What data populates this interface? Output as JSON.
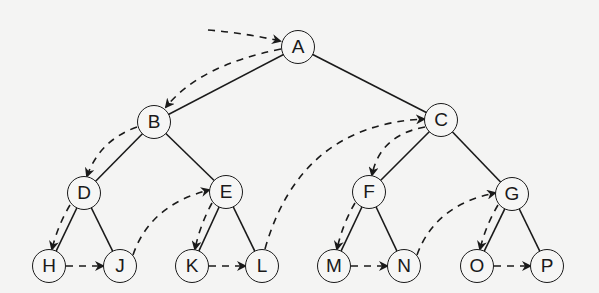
{
  "diagram": {
    "type": "binary-tree-preorder-traversal",
    "traversal_order": [
      "A",
      "B",
      "D",
      "H",
      "J",
      "E",
      "K",
      "L",
      "C",
      "F",
      "M",
      "N",
      "G",
      "O",
      "P"
    ],
    "colors": {
      "background": "#f4f4f3",
      "stroke": "#1a1a1a"
    },
    "nodes": [
      {
        "id": "A",
        "label": "A",
        "x": 298,
        "y": 47
      },
      {
        "id": "B",
        "label": "B",
        "x": 154,
        "y": 122
      },
      {
        "id": "C",
        "label": "C",
        "x": 441,
        "y": 120
      },
      {
        "id": "D",
        "label": "D",
        "x": 84,
        "y": 193
      },
      {
        "id": "E",
        "label": "E",
        "x": 226,
        "y": 192
      },
      {
        "id": "F",
        "label": "F",
        "x": 369,
        "y": 192
      },
      {
        "id": "G",
        "label": "G",
        "x": 512,
        "y": 194
      },
      {
        "id": "H",
        "label": "H",
        "x": 49,
        "y": 266
      },
      {
        "id": "J",
        "label": "J",
        "x": 120,
        "y": 266
      },
      {
        "id": "K",
        "label": "K",
        "x": 192,
        "y": 266
      },
      {
        "id": "L",
        "label": "L",
        "x": 262,
        "y": 266
      },
      {
        "id": "M",
        "label": "M",
        "x": 334,
        "y": 266
      },
      {
        "id": "N",
        "label": "N",
        "x": 404,
        "y": 266
      },
      {
        "id": "O",
        "label": "O",
        "x": 477,
        "y": 266
      },
      {
        "id": "P",
        "label": "P",
        "x": 547,
        "y": 266
      }
    ],
    "edges": [
      [
        "A",
        "B"
      ],
      [
        "A",
        "C"
      ],
      [
        "B",
        "D"
      ],
      [
        "B",
        "E"
      ],
      [
        "C",
        "F"
      ],
      [
        "C",
        "G"
      ],
      [
        "D",
        "H"
      ],
      [
        "D",
        "J"
      ],
      [
        "E",
        "K"
      ],
      [
        "E",
        "L"
      ],
      [
        "F",
        "M"
      ],
      [
        "F",
        "N"
      ],
      [
        "G",
        "O"
      ],
      [
        "G",
        "P"
      ]
    ],
    "traversal_arrows": [
      {
        "from": "start",
        "to": "A",
        "path": "M208,30 Q245,33 280,41"
      },
      {
        "from": "A",
        "to": "B",
        "path": "M281,49 Q200,65 166,107"
      },
      {
        "from": "B",
        "to": "D",
        "path": "M137,127 Q100,140 87,176"
      },
      {
        "from": "D",
        "to": "H",
        "path": "M70,205 Q58,225 52,249"
      },
      {
        "from": "H",
        "to": "J",
        "path": "M66,266 L103,266"
      },
      {
        "from": "J",
        "to": "E",
        "path": "M133,255 Q150,205 209,190"
      },
      {
        "from": "E",
        "to": "K",
        "path": "M212,203 Q200,225 195,249"
      },
      {
        "from": "K",
        "to": "L",
        "path": "M209,266 L245,266"
      },
      {
        "from": "L",
        "to": "C",
        "path": "M265,249 Q300,125 424,119"
      },
      {
        "from": "C",
        "to": "F",
        "path": "M425,127 Q380,135 372,175"
      },
      {
        "from": "F",
        "to": "M",
        "path": "M355,203 Q343,223 337,249"
      },
      {
        "from": "M",
        "to": "N",
        "path": "M351,266 L387,266"
      },
      {
        "from": "N",
        "to": "G",
        "path": "M417,255 Q435,205 495,193"
      },
      {
        "from": "G",
        "to": "O",
        "path": "M498,205 Q486,225 480,249"
      },
      {
        "from": "O",
        "to": "P",
        "path": "M494,266 L530,266"
      }
    ]
  }
}
